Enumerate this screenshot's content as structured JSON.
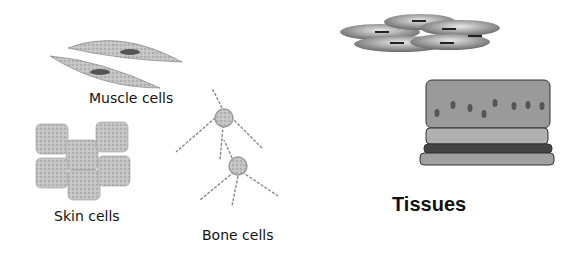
{
  "labels": {
    "muscle": "Muscle cells",
    "skin": "Skin cells",
    "bone": "Bone cells",
    "tissues": "Tissues"
  },
  "colors": {
    "cell_fill": "#b8b8b8",
    "tissue_top": "#9a9a9a",
    "tissue_band": "#444444",
    "text": "#111111"
  }
}
